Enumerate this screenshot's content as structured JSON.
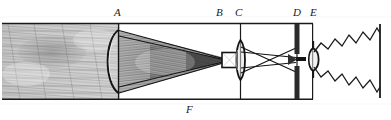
{
  "figure": {
    "kind": "optical-ray-diagram",
    "style": "antique engraving, monochrome line art with hatched shading",
    "canvas": {
      "width": 391,
      "height": 120
    },
    "background_color": "#ffffff",
    "ink_color": "#1a1a1a"
  },
  "labels": [
    {
      "id": "A",
      "text": "A",
      "x": 114,
      "y": 8,
      "role": "large plano-convex condenser lens at tube mouth"
    },
    {
      "id": "B",
      "text": "B",
      "x": 216,
      "y": 8,
      "role": "rectangular aperture / object slide at focus"
    },
    {
      "id": "C",
      "text": "C",
      "x": 235,
      "y": 8,
      "role": "biconvex objective lens"
    },
    {
      "id": "D",
      "text": "D",
      "x": 293,
      "y": 8,
      "role": "inner diaphragm plate with central stop"
    },
    {
      "id": "E",
      "text": "E",
      "x": 310,
      "y": 8,
      "role": "small eye lens at tube end"
    },
    {
      "id": "F",
      "text": "F",
      "x": 186,
      "y": 104,
      "role": "tube body / barrel"
    }
  ],
  "elements": {
    "tube": {
      "name": "instrument-tube",
      "top_y": 23,
      "bottom_y": 99,
      "left_x": 2,
      "right_x": 313
    },
    "hatched_field": {
      "name": "hatched-beam-field",
      "description": "engraved cross-hatched shading filling the tube left of A and the converging cone A to B",
      "left_x": 2,
      "right_x": 228
    },
    "lens_A": {
      "type": "plano-convex",
      "x": 118,
      "half_height": 34,
      "bulge": "left"
    },
    "aperture_B": {
      "type": "rectangular-stop",
      "x": 222,
      "half_height": 8
    },
    "lens_C": {
      "type": "biconvex",
      "x": 240,
      "half_height": 20
    },
    "plate_D": {
      "type": "diaphragm-plate",
      "x": 297,
      "gap_half_height": 6
    },
    "lens_E": {
      "type": "small-biconvex-eye-lens",
      "x": 313,
      "half_height": 11
    },
    "screen": {
      "name": "projection-screen",
      "x": 380,
      "top_y": 24,
      "bottom_y": 98
    },
    "rays": {
      "description": "straight rays converge from lens A to focus at B, pass lens C, cross in an X between C and D, exit through E and diverge as two zig-zag bands to the screen",
      "crossing_region": "between C and D",
      "zigzag_bands": 2
    }
  }
}
